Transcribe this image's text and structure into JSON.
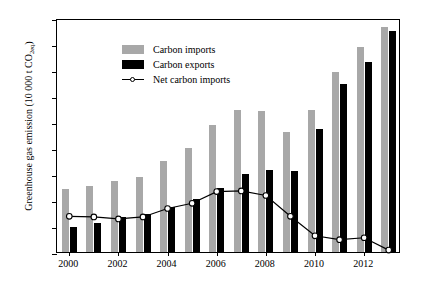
{
  "chart_data": {
    "type": "bar",
    "title": "",
    "subtitle": "",
    "xlabel": "",
    "ylabel": "Greenhouse gas emission (10 000 t CO2eq)",
    "ylabel_main": "Greenhouse gas emission (10 000 t CO",
    "ylabel_sub": "2eq",
    "ylabel_tail": ")",
    "categories": [
      2000,
      2001,
      2002,
      2003,
      2004,
      2005,
      2006,
      2007,
      2008,
      2009,
      2010,
      2011,
      2012,
      2013
    ],
    "x_tick_labels": [
      "2000",
      "2002",
      "2004",
      "2006",
      "2008",
      "2010",
      "2012"
    ],
    "x_tick_values": [
      2000,
      2002,
      2004,
      2006,
      2008,
      2010,
      2012
    ],
    "y_tick_labels": [
      "0",
      "200",
      "400",
      "600",
      "800",
      "1000",
      "1200",
      "1400",
      "1600",
      "1800"
    ],
    "y_tick_values": [
      0,
      200,
      400,
      600,
      800,
      1000,
      1200,
      1400,
      1600,
      1800
    ],
    "ylim": [
      0,
      1800
    ],
    "grid": false,
    "legend_position": "top-left",
    "series": [
      {
        "name": "Carbon imports",
        "kind": "bar",
        "color": "#a8a8a8",
        "values": [
          485,
          510,
          545,
          580,
          700,
          800,
          975,
          1090,
          1085,
          920,
          1090,
          1385,
          1580,
          1730
        ]
      },
      {
        "name": "Carbon exports",
        "kind": "bar",
        "color": "#000000",
        "values": [
          190,
          220,
          270,
          295,
          345,
          410,
          490,
          600,
          630,
          625,
          945,
          1290,
          1465,
          1700
        ]
      },
      {
        "name": "Net carbon imports",
        "kind": "line",
        "color": "#000000",
        "marker": "open-circle",
        "values": [
          290,
          285,
          270,
          285,
          350,
          390,
          480,
          485,
          450,
          290,
          140,
          110,
          125,
          30
        ]
      }
    ]
  },
  "legend": {
    "items": [
      {
        "label": "Carbon imports",
        "type": "swatch-gray"
      },
      {
        "label": "Carbon exports",
        "type": "swatch-black"
      },
      {
        "label": "Net carbon imports",
        "type": "line-marker"
      }
    ]
  }
}
